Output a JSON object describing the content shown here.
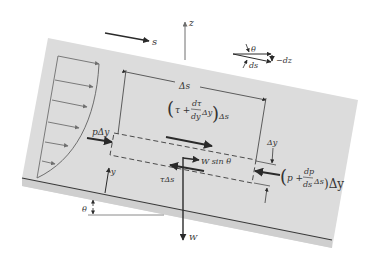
{
  "diagram": {
    "type": "free-body diagram of fluid element in inclined laminar flow",
    "colors": {
      "slab": "#dcdcdc",
      "slab_edge": "#c8c8c8",
      "line": "#3a3a3a",
      "profile": "#6e6e6e",
      "text": "#333333"
    },
    "axes": {
      "s_label": "s",
      "z_label": "z",
      "y_label": "y"
    },
    "inset": {
      "theta_label": "θ",
      "ds_label": "ds",
      "dz_label": "−dz"
    },
    "dimensions": {
      "delta_s": "Δs",
      "delta_y": "Δy"
    },
    "forces": {
      "left_pressure": "pΔy",
      "right_pressure_open": "(",
      "right_pressure_p": "p +",
      "right_pressure_num": "dp",
      "right_pressure_den": "ds",
      "right_pressure_tail": "Δs",
      "right_pressure_close": ")Δy",
      "top_shear_tau": "τ +",
      "top_shear_num": "dτ",
      "top_shear_den": "dy",
      "top_shear_tail": "Δy",
      "top_shear_close": ")Δs",
      "bottom_shear": "τΔs",
      "weight_component": "W sin θ",
      "weight": "W"
    },
    "angle_label": "θ"
  }
}
